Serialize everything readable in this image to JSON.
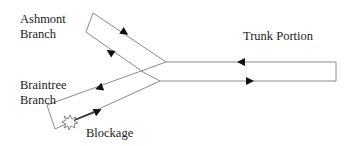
{
  "diagram": {
    "labels": {
      "ashmont_line1": "Ashmont",
      "ashmont_line2": "Branch",
      "braintree_line1": "Braintree",
      "braintree_line2": "Branch",
      "trunk": "Trunk Portion",
      "blockage": "Blockage"
    },
    "colors": {
      "line": "#8a8a8a",
      "arrow": "#111111",
      "text": "#1a1a1a",
      "background": "#ffffff"
    },
    "elements": {
      "ashmont_loop": {
        "corners": [
          [
            93,
            13
          ],
          [
            86,
            32
          ]
        ],
        "arrows": [
          "down-right on upper line",
          "up-left on lower line"
        ]
      },
      "trunk_loop": {
        "top_y": 62,
        "bottom_y": 81,
        "right_x": 336,
        "arrows": [
          "left on top line",
          "right on bottom line"
        ]
      },
      "braintree_loop": {
        "corners": [
          [
            47,
            105
          ],
          [
            55,
            129
          ]
        ],
        "arrows": [
          "down-left on upper line",
          "up-right on lower line"
        ]
      },
      "blockage_marker": {
        "position": [
          70,
          122
        ],
        "shape": "starburst"
      }
    }
  }
}
